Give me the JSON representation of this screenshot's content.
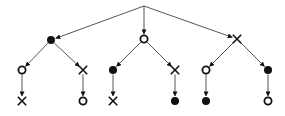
{
  "diagram": {
    "type": "tree",
    "colors": {
      "edge": "#555555",
      "node": "#111111",
      "background": "#ffffff"
    },
    "nodes": [
      {
        "id": "root",
        "x": 144,
        "y": 6,
        "mark": "none"
      },
      {
        "id": "L",
        "x": 51,
        "y": 40,
        "mark": "filled"
      },
      {
        "id": "M",
        "x": 144,
        "y": 39,
        "mark": "open"
      },
      {
        "id": "R",
        "x": 237,
        "y": 39,
        "mark": "cross"
      },
      {
        "id": "LL",
        "x": 22,
        "y": 70,
        "mark": "open"
      },
      {
        "id": "LR",
        "x": 83,
        "y": 70,
        "mark": "cross"
      },
      {
        "id": "ML",
        "x": 113,
        "y": 70,
        "mark": "filled"
      },
      {
        "id": "MR",
        "x": 175,
        "y": 70,
        "mark": "cross"
      },
      {
        "id": "RL",
        "x": 206,
        "y": 70,
        "mark": "open"
      },
      {
        "id": "RR",
        "x": 268,
        "y": 70,
        "mark": "filled"
      },
      {
        "id": "LLc",
        "x": 22,
        "y": 101,
        "mark": "cross"
      },
      {
        "id": "LRc",
        "x": 83,
        "y": 101,
        "mark": "open"
      },
      {
        "id": "MLc",
        "x": 113,
        "y": 101,
        "mark": "cross"
      },
      {
        "id": "MRc",
        "x": 175,
        "y": 101,
        "mark": "filled"
      },
      {
        "id": "RLc",
        "x": 206,
        "y": 101,
        "mark": "filled"
      },
      {
        "id": "RRc",
        "x": 268,
        "y": 101,
        "mark": "open"
      }
    ],
    "edges": [
      [
        "root",
        "L"
      ],
      [
        "root",
        "M"
      ],
      [
        "root",
        "R"
      ],
      [
        "L",
        "LL"
      ],
      [
        "L",
        "LR"
      ],
      [
        "M",
        "ML"
      ],
      [
        "M",
        "MR"
      ],
      [
        "R",
        "RL"
      ],
      [
        "R",
        "RR"
      ],
      [
        "LL",
        "LLc"
      ],
      [
        "LR",
        "LRc"
      ],
      [
        "ML",
        "MLc"
      ],
      [
        "MR",
        "MRc"
      ],
      [
        "RL",
        "RLc"
      ],
      [
        "RR",
        "RRc"
      ]
    ]
  }
}
